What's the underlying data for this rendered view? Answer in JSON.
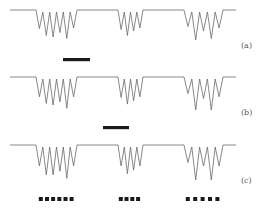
{
  "figure": {
    "panels": [
      {
        "id": "a",
        "label": "(a)",
        "marker": {
          "type": "solid-bar"
        },
        "groups": [
          {
            "dips": [
              0.62,
              0.85,
              0.9,
              0.75,
              0.95,
              0.6
            ],
            "dip_count": 6
          },
          {
            "dips": [
              0.65,
              0.85,
              0.7,
              0.6
            ],
            "dip_count": 4
          },
          {
            "dips": [
              0.55,
              1.0,
              0.7,
              0.95,
              0.6
            ],
            "dip_count": 5
          }
        ]
      },
      {
        "id": "b",
        "label": "(b)",
        "marker": {
          "type": "solid-bar"
        },
        "groups": [
          {
            "dips": [
              0.6,
              0.8,
              0.85,
              0.75,
              0.95,
              0.6
            ],
            "dip_count": 6
          },
          {
            "dips": [
              0.62,
              0.82,
              0.72,
              0.6
            ],
            "dip_count": 4
          },
          {
            "dips": [
              0.5,
              1.0,
              0.65,
              1.0,
              0.6
            ],
            "dip_count": 5
          }
        ]
      },
      {
        "id": "c",
        "label": "(c)",
        "marker": {
          "type": "dotted-squares",
          "counts": [
            6,
            4,
            5
          ]
        },
        "groups": [
          {
            "dips": [
              0.6,
              0.85,
              0.85,
              0.75,
              0.95,
              0.6
            ],
            "dip_count": 6
          },
          {
            "dips": [
              0.6,
              0.82,
              0.72,
              0.6
            ],
            "dip_count": 4
          },
          {
            "dips": [
              0.5,
              1.0,
              0.6,
              1.0,
              0.6
            ],
            "dip_count": 5
          }
        ]
      }
    ]
  }
}
